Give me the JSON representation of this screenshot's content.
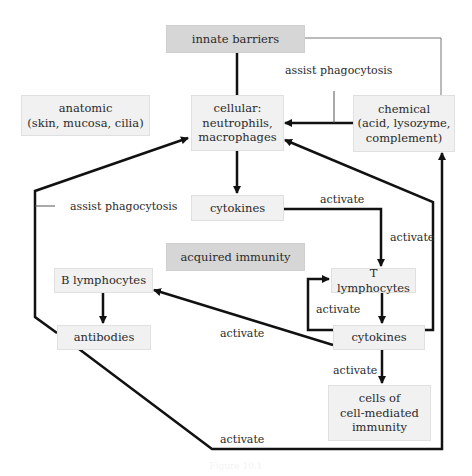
{
  "diagram": {
    "nodes": {
      "innate_barriers": "innate barriers",
      "anatomic": "anatomic\n(skin, mucosa, cilia)",
      "cellular": "cellular:\nneutrophils,\nmacrophages",
      "chemical": "chemical\n(acid, lysozyme,\ncomplement)",
      "cytokines_innate": "cytokines",
      "acquired_immunity": "acquired immunity",
      "b_lymphocytes": "B lymphocytes",
      "t_lymphocytes": "T lymphocytes",
      "antibodies": "antibodies",
      "cytokines_acquired": "cytokines",
      "cell_mediated": "cells of\ncell-mediated\nimmunity"
    },
    "edge_labels": {
      "assist_phagocytosis_chemical": "assist phagocytosis",
      "assist_phagocytosis_antibodies": "assist phagocytosis",
      "activate_cytokines_to_t": "activate",
      "activate_right_vertical": "activate",
      "activate_t_loop": "activate",
      "activate_b": "activate",
      "activate_cell_mediated": "activate",
      "activate_bottom": "activate"
    },
    "edges": [
      {
        "from": "innate barriers",
        "to": "cellular",
        "type": "line"
      },
      {
        "from": "innate barriers",
        "to": "chemical",
        "type": "thin line"
      },
      {
        "from": "chemical",
        "to": "cellular",
        "label": "assist phagocytosis"
      },
      {
        "from": "cellular",
        "to": "cytokines"
      },
      {
        "from": "cytokines",
        "to": "T lymphocytes",
        "label": "activate"
      },
      {
        "from": "T lymphocytes",
        "to": "cytokines (acquired)"
      },
      {
        "from": "cytokines (acquired)",
        "to": "T lymphocytes",
        "label": "activate"
      },
      {
        "from": "cytokines (acquired)",
        "to": "B lymphocytes",
        "label": "activate"
      },
      {
        "from": "B lymphocytes",
        "to": "antibodies"
      },
      {
        "from": "antibodies",
        "to": "cellular",
        "label": "assist phagocytosis"
      },
      {
        "from": "antibodies",
        "to": "chemical",
        "label": "activate"
      },
      {
        "from": "cytokines (acquired)",
        "to": "cellular",
        "label": "activate"
      },
      {
        "from": "cytokines (acquired)",
        "to": "cells of cell-mediated immunity",
        "label": "activate"
      }
    ]
  },
  "caption": "Figure 10.1"
}
